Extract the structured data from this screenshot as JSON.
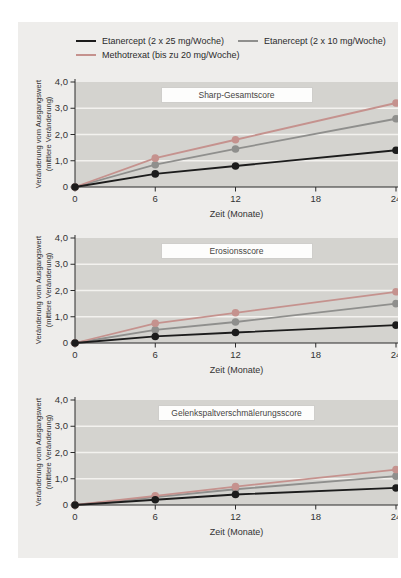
{
  "colors": {
    "page_bg": "#ffffff",
    "panel_bg": "#eeedeb",
    "plot_bg": "#d4d3cf",
    "gridline": "#f3f2ef",
    "axis": "#2a2a2a",
    "tick_text": "#333333",
    "title_box_bg": "#fdfdfc",
    "title_box_border": "#cfcecb",
    "series_etanercept_25": "#1c1c1c",
    "series_etanercept_10": "#8f8f8d",
    "series_methotrexat": "#c5928e"
  },
  "legend": {
    "items": [
      {
        "label": "Etanercept (2 x 25 mg/Woche)",
        "color": "#1c1c1c"
      },
      {
        "label": "Etanercept (2 x 10 mg/Woche)",
        "color": "#8f8f8d"
      },
      {
        "label": "Methotrexat (bis zu 20 mg/Woche)",
        "color": "#c5928e"
      }
    ]
  },
  "axes": {
    "xlabel": "Zeit (Monate)",
    "ylabel_line1": "Veränderung vom Ausgangswert",
    "ylabel_line2": "(mittlere Veränderung)",
    "x_ticks": [
      {
        "label": "0",
        "value": 0
      },
      {
        "label": "6",
        "value": 6
      },
      {
        "label": "12",
        "value": 12
      },
      {
        "label": "18",
        "value": 18
      },
      {
        "label": "24",
        "value": 24
      }
    ],
    "y_ticks": [
      {
        "label": "0",
        "value": 0
      },
      {
        "label": "1,0",
        "value": 1
      },
      {
        "label": "2,0",
        "value": 2
      },
      {
        "label": "3,0",
        "value": 3
      },
      {
        "label": "4,0",
        "value": 4
      }
    ]
  },
  "chart_data": [
    {
      "type": "line",
      "title": "Sharp-Gesamtscore",
      "xlabel": "Zeit (Monate)",
      "ylabel": "Veränderung vom Ausgangswert (mittlere Veränderung)",
      "x": [
        0,
        6,
        12,
        24
      ],
      "xlim": [
        0,
        24
      ],
      "ylim": [
        0,
        4
      ],
      "grid_y": [
        1,
        2,
        3
      ],
      "series": [
        {
          "name": "Etanercept (2 x 25 mg/Woche)",
          "color": "#1c1c1c",
          "values": [
            0,
            0.5,
            0.8,
            1.4
          ]
        },
        {
          "name": "Etanercept (2 x 10 mg/Woche)",
          "color": "#8f8f8d",
          "values": [
            0,
            0.85,
            1.45,
            2.6
          ]
        },
        {
          "name": "Methotrexat (bis zu 20 mg/Woche)",
          "color": "#c5928e",
          "values": [
            0,
            1.1,
            1.8,
            3.2
          ]
        }
      ]
    },
    {
      "type": "line",
      "title": "Erosionsscore",
      "xlabel": "Zeit (Monate)",
      "ylabel": "Veränderung vom Ausgangswert (mittlere Veränderung)",
      "x": [
        0,
        6,
        12,
        24
      ],
      "xlim": [
        0,
        24
      ],
      "ylim": [
        0,
        4
      ],
      "grid_y": [
        1,
        2,
        3
      ],
      "series": [
        {
          "name": "Etanercept (2 x 25 mg/Woche)",
          "color": "#1c1c1c",
          "values": [
            0,
            0.25,
            0.4,
            0.68
          ]
        },
        {
          "name": "Etanercept (2 x 10 mg/Woche)",
          "color": "#8f8f8d",
          "values": [
            0,
            0.5,
            0.8,
            1.5
          ]
        },
        {
          "name": "Methotrexat (bis zu 20 mg/Woche)",
          "color": "#c5928e",
          "values": [
            0,
            0.75,
            1.15,
            1.95
          ]
        }
      ]
    },
    {
      "type": "line",
      "title": "Gelenkspaltverschmälerungsscore",
      "xlabel": "Zeit (Monate)",
      "ylabel": "Veränderung vom Ausgangswert (mittlere Veränderung)",
      "x": [
        0,
        6,
        12,
        24
      ],
      "xlim": [
        0,
        24
      ],
      "ylim": [
        0,
        4
      ],
      "grid_y": [
        1,
        2,
        3
      ],
      "series": [
        {
          "name": "Etanercept (2 x 25 mg/Woche)",
          "color": "#1c1c1c",
          "values": [
            0,
            0.2,
            0.4,
            0.65
          ]
        },
        {
          "name": "Etanercept (2 x 10 mg/Woche)",
          "color": "#8f8f8d",
          "values": [
            0,
            0.3,
            0.6,
            1.1
          ]
        },
        {
          "name": "Methotrexat (bis zu 20 mg/Woche)",
          "color": "#c5928e",
          "values": [
            0,
            0.35,
            0.7,
            1.35
          ]
        }
      ]
    }
  ]
}
